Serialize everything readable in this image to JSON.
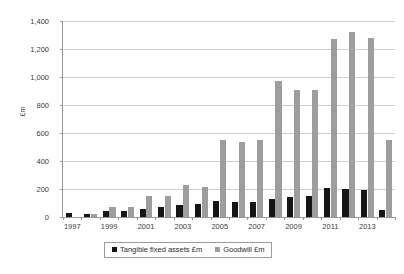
{
  "chart_data": {
    "type": "bar",
    "title": "",
    "xlabel": "",
    "ylabel": "£m",
    "ylim": [
      0,
      1400
    ],
    "ytick_step": 200,
    "grid": true,
    "legend_position": "bottom",
    "categories": [
      "1997",
      "1998",
      "1999",
      "2000",
      "2001",
      "2002",
      "2003",
      "2004",
      "2005",
      "2006",
      "2007",
      "2008",
      "2009",
      "2010",
      "2011",
      "2012",
      "2013",
      "2014"
    ],
    "xtick_labels_shown": [
      "1997",
      "1999",
      "2001",
      "2003",
      "2005",
      "2007",
      "2009",
      "2011",
      "2013"
    ],
    "ytick_labels": [
      "0",
      "200",
      "400",
      "600",
      "800",
      "1,000",
      "1,200",
      "1,400"
    ],
    "series": [
      {
        "name": "Tangible fixed assets £m",
        "color": "#151515",
        "values": [
          30,
          25,
          40,
          45,
          55,
          70,
          85,
          90,
          115,
          105,
          108,
          128,
          140,
          148,
          205,
          203,
          190,
          50
        ]
      },
      {
        "name": "Goodwill £m",
        "color": "#9d9d9d",
        "values": [
          0,
          18,
          72,
          72,
          148,
          152,
          228,
          215,
          550,
          535,
          548,
          975,
          905,
          905,
          1270,
          1320,
          1280,
          550
        ]
      }
    ]
  },
  "legend": {
    "entries": [
      {
        "label": "Tangible fixed assets £m",
        "swatch": "tangible-swatch"
      },
      {
        "label": "Goodwill £m",
        "swatch": "goodwill-swatch"
      }
    ]
  },
  "axis": {
    "y_title": "£m"
  }
}
